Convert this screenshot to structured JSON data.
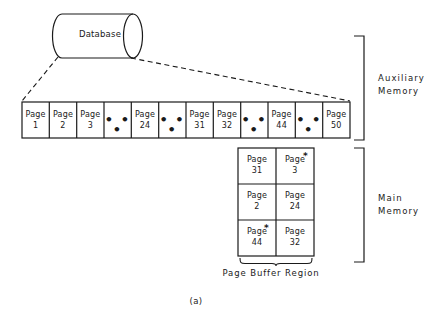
{
  "figure": {
    "caption": "(a)",
    "database": {
      "label": "Database"
    },
    "auxiliary_memory": {
      "bracket_label_line1": "Auxiliary",
      "bracket_label_line2": "Memory",
      "cells": [
        {
          "type": "page",
          "word": "Page",
          "number": "1"
        },
        {
          "type": "page",
          "word": "Page",
          "number": "2"
        },
        {
          "type": "page",
          "word": "Page",
          "number": "3"
        },
        {
          "type": "ellipsis",
          "text": "• • •"
        },
        {
          "type": "page",
          "word": "Page",
          "number": "24"
        },
        {
          "type": "ellipsis",
          "text": "• • •"
        },
        {
          "type": "page",
          "word": "Page",
          "number": "31"
        },
        {
          "type": "page",
          "word": "Page",
          "number": "32"
        },
        {
          "type": "ellipsis",
          "text": "• • •"
        },
        {
          "type": "page",
          "word": "Page",
          "number": "44"
        },
        {
          "type": "ellipsis",
          "text": "• • •"
        },
        {
          "type": "page",
          "word": "Page",
          "number": "50"
        }
      ]
    },
    "main_memory": {
      "bracket_label_line1": "Main",
      "bracket_label_line2": "Memory",
      "page_buffer_region_label": "Page Buffer Region",
      "modified_marker": "*",
      "buffer_cells": [
        {
          "word": "Page",
          "number": "31",
          "modified": false
        },
        {
          "word": "Page",
          "number": "3",
          "modified": true
        },
        {
          "word": "Page",
          "number": "2",
          "modified": false
        },
        {
          "word": "Page",
          "number": "24",
          "modified": false
        },
        {
          "word": "Page",
          "number": "44",
          "modified": true
        },
        {
          "word": "Page",
          "number": "32",
          "modified": false
        }
      ]
    }
  },
  "colors": {
    "ink": "#1a1a1a",
    "background": "#ffffff"
  }
}
